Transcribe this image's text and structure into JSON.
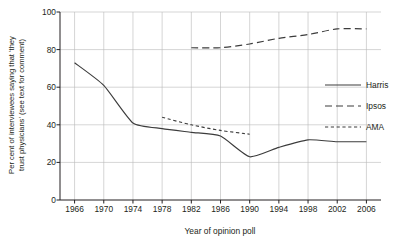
{
  "chart_data": {
    "type": "line",
    "title": "",
    "xlabel": "Year of opinion poll",
    "ylabel": "Per cent of interviewees saying that 'they trust physicians' (see text for comment)",
    "ylabel_line1": "Per cent of interviewees saying that 'they",
    "ylabel_line2": "trust physicians' (see text for comment)",
    "xlim": [
      1964,
      2008
    ],
    "ylim": [
      0,
      100
    ],
    "xticks": [
      1966,
      1970,
      1974,
      1978,
      1982,
      1986,
      1990,
      1994,
      1998,
      2002,
      2006
    ],
    "yticks": [
      0,
      20,
      40,
      60,
      80,
      100
    ],
    "xtick_labels": [
      "1966",
      "1970",
      "1974",
      "1978",
      "1982",
      "1986",
      "1990",
      "1994",
      "1998",
      "2002",
      "2006"
    ],
    "ytick_labels": [
      "0",
      "20",
      "40",
      "60",
      "80",
      "100"
    ],
    "grid": true,
    "legend_position": "right-middle",
    "series": [
      {
        "name": "Harris",
        "style": "solid",
        "color": "#3c3c3c",
        "x": [
          1966,
          1970,
          1974,
          1978,
          1982,
          1986,
          1990,
          1994,
          1998,
          2002,
          2006
        ],
        "values": [
          73,
          61,
          41,
          38,
          36,
          34,
          23,
          28,
          32,
          31,
          31
        ]
      },
      {
        "name": "Ipsos",
        "style": "long-dash",
        "color": "#3c3c3c",
        "x": [
          1982,
          1986,
          1990,
          1994,
          1998,
          2002,
          2006
        ],
        "values": [
          81,
          81,
          83,
          86,
          88,
          91,
          91
        ]
      },
      {
        "name": "AMA",
        "style": "short-dash",
        "color": "#3c3c3c",
        "x": [
          1978,
          1982,
          1986,
          1990
        ],
        "values": [
          44,
          40,
          37,
          35
        ]
      }
    ],
    "legend": [
      {
        "label": "Harris",
        "style": "solid"
      },
      {
        "label": "Ipsos",
        "style": "long-dash"
      },
      {
        "label": "AMA",
        "style": "short-dash"
      }
    ],
    "colors": {
      "axis": "#231f20",
      "grid": "#b8b8b8",
      "line": "#3c3c3c",
      "background": "#ffffff"
    }
  }
}
